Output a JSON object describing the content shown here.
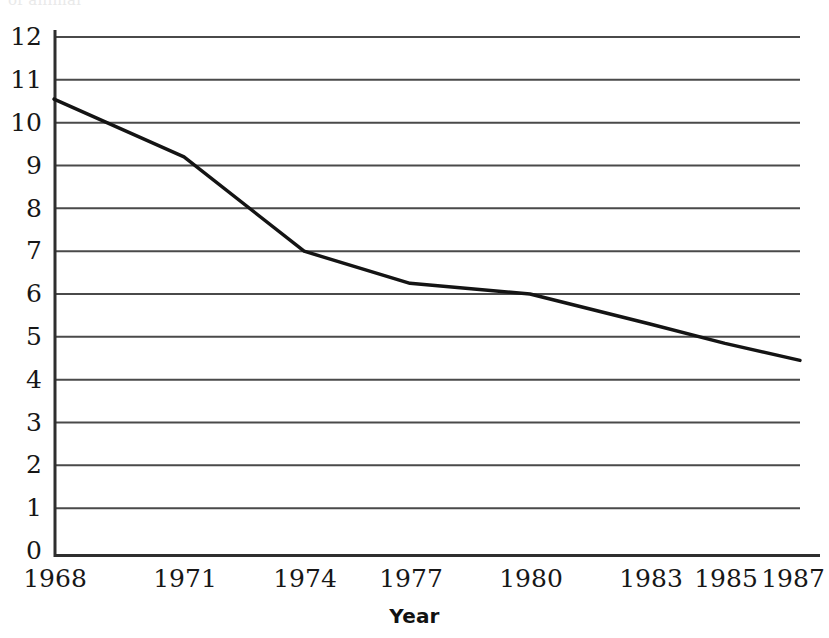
{
  "top_caption_fragment": "of animal",
  "chart_data": {
    "type": "line",
    "title": "",
    "subtitle": "",
    "xlabel": "Year",
    "ylabel": "",
    "x": [
      1968,
      1971,
      1974,
      1977,
      1980,
      1983,
      1985,
      1987
    ],
    "categories": [
      "1968",
      "1971",
      "1974",
      "1977",
      "1980",
      "1983",
      "1985",
      "1987"
    ],
    "values": [
      10.55,
      9.2,
      7.0,
      6.25,
      6.0,
      5.3,
      4.85,
      4.45
    ],
    "series": [
      {
        "name": "",
        "values": [
          10.55,
          9.2,
          7.0,
          6.25,
          6.0,
          5.3,
          4.85,
          4.45
        ]
      }
    ],
    "xlim": [
      1968,
      1987
    ],
    "ylim": [
      0,
      12
    ],
    "ytick_labels": [
      "12",
      "11",
      "10",
      "9",
      "8",
      "7",
      "6",
      "5",
      "4",
      "3",
      "2",
      "1",
      "0"
    ],
    "ytick_values": [
      12,
      11,
      10,
      9,
      8,
      7,
      6,
      5,
      4,
      3,
      2,
      1,
      0
    ],
    "xtick_labels": [
      "1968",
      "1971",
      "1974",
      "1977",
      "1980",
      "1983",
      "1985",
      "1987"
    ],
    "xtick_pixel_fractions": [
      0.0,
      0.1743,
      0.3352,
      0.4772,
      0.6381,
      0.7989,
      0.8995,
      1.0
    ],
    "grid": "horizontal",
    "legend": "none",
    "line_color": "#141414",
    "line_width": 3,
    "axis_color": "#3a3a3a",
    "grid_color": "#4a4a4a",
    "background": "#ffffff",
    "annotations": []
  },
  "plot_geometry": {
    "left_px": 54,
    "right_px": 800,
    "top_px": 37,
    "bottom_px": 551,
    "axis_bottom_px": 557
  }
}
